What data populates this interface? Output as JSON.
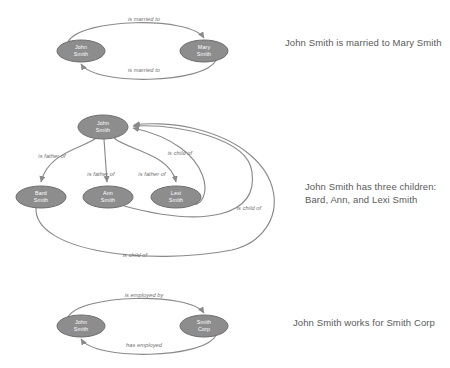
{
  "document": {
    "title": "Knowledge graph relationship examples",
    "background_color": "#ffffff",
    "node_fill_color": "#8d8d8d",
    "node_stroke_color": "#6f6f6f",
    "node_text_color": "#ffffff",
    "edge_color": "#8a8a8a",
    "caption_text_color": "#5a5a5a",
    "edge_label_color": "#6e6e6e"
  },
  "sections": [
    {
      "id": "married",
      "caption": "John Smith is married to Mary Smith",
      "nodes": [
        {
          "id": "john",
          "line1": "John",
          "line2": "Smith",
          "cx": 81,
          "cy": 51,
          "rx": 24,
          "ry": 11
        },
        {
          "id": "mary",
          "line1": "Mary",
          "line2": "Smith",
          "cx": 204,
          "cy": 51,
          "rx": 24,
          "ry": 11
        }
      ],
      "edges": [
        {
          "id": "john-married-mary",
          "label": "is married to",
          "from": "john",
          "to": "mary",
          "label_x": 144,
          "label_y": 21
        },
        {
          "id": "mary-married-john",
          "label": "is married to",
          "from": "mary",
          "to": "john",
          "label_x": 144,
          "label_y": 72
        }
      ]
    },
    {
      "id": "children",
      "caption": "John Smith has three children:\nBard, Ann, and Lexi Smith",
      "nodes": [
        {
          "id": "john",
          "line1": "John",
          "line2": "Smith",
          "cx": 103,
          "cy": 27,
          "rx": 25,
          "ry": 12
        },
        {
          "id": "bard",
          "line1": "Bard",
          "line2": "Smith",
          "cx": 41,
          "cy": 97,
          "rx": 25,
          "ry": 11
        },
        {
          "id": "ann",
          "line1": "Ann",
          "line2": "Smith",
          "cx": 108,
          "cy": 97,
          "rx": 25,
          "ry": 11
        },
        {
          "id": "lexi",
          "line1": "Lexi",
          "line2": "Smith",
          "cx": 176,
          "cy": 97,
          "rx": 25,
          "ry": 11
        }
      ],
      "edges": [
        {
          "id": "john-father-bard",
          "label": "is father of",
          "from": "john",
          "to": "bard",
          "label_x": 52,
          "label_y": 58
        },
        {
          "id": "john-father-ann",
          "label": "is father of",
          "from": "john",
          "to": "ann",
          "label_x": 101,
          "label_y": 76
        },
        {
          "id": "john-father-lexi",
          "label": "is father of",
          "from": "john",
          "to": "lexi",
          "label_x": 152,
          "label_y": 76
        },
        {
          "id": "lexi-child-john",
          "label": "is child of",
          "from": "lexi",
          "to": "john",
          "label_x": 180,
          "label_y": 55
        },
        {
          "id": "ann-child-john",
          "label": "is child of",
          "from": "ann",
          "to": "john",
          "label_x": 249,
          "label_y": 110
        },
        {
          "id": "bard-child-john",
          "label": "is child of",
          "from": "bard",
          "to": "john",
          "label_x": 135,
          "label_y": 157
        }
      ]
    },
    {
      "id": "employment",
      "caption": "John Smith works for Smith Corp",
      "nodes": [
        {
          "id": "john",
          "line1": "John",
          "line2": "Smith",
          "cx": 81,
          "cy": 41,
          "rx": 24,
          "ry": 11
        },
        {
          "id": "corp",
          "line1": "Smith",
          "line2": "Corp",
          "cx": 204,
          "cy": 41,
          "rx": 24,
          "ry": 11
        }
      ],
      "edges": [
        {
          "id": "john-employed-by-corp",
          "label": "is employed by",
          "from": "john",
          "to": "corp",
          "label_x": 144,
          "label_y": 12
        },
        {
          "id": "corp-has-employed-john",
          "label": "has employed",
          "from": "corp",
          "to": "john",
          "label_x": 144,
          "label_y": 62
        }
      ]
    }
  ]
}
